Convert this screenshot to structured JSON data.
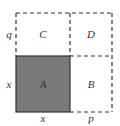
{
  "diagram": {
    "regions": [
      {
        "id": "A",
        "label": "A",
        "fill": "#7a7a7a",
        "border": "solid"
      },
      {
        "id": "B",
        "label": "B",
        "fill": "#ffffff",
        "border": "dashed"
      },
      {
        "id": "C",
        "label": "C",
        "fill": "#ffffff",
        "border": "dashed"
      },
      {
        "id": "D",
        "label": "D",
        "fill": "#ffffff",
        "border": "dashed"
      }
    ],
    "side_labels": {
      "left_top": "q",
      "left_bottom": "x",
      "bottom_left": "x",
      "bottom_right": "p"
    },
    "colors": {
      "shaded": "#7a7a7a",
      "line": "#333333"
    }
  }
}
